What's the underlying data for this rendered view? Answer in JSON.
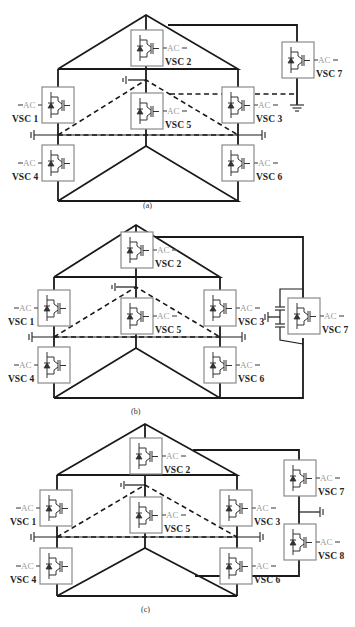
{
  "figure": {
    "ac_label": "AC",
    "panels": [
      {
        "id": "a",
        "caption": "(a)",
        "offset_y": 0,
        "converters": [
          {
            "id": "vsc1",
            "label": "VSC 1",
            "x": 42,
            "y": 87,
            "ac_side": "left"
          },
          {
            "id": "vsc2",
            "label": "VSC 2",
            "x": 131,
            "y": 30,
            "ac_side": "right"
          },
          {
            "id": "vsc3",
            "label": "VSC 3",
            "x": 222,
            "y": 87,
            "ac_side": "right"
          },
          {
            "id": "vsc4",
            "label": "VSC 4",
            "x": 42,
            "y": 145,
            "ac_side": "left"
          },
          {
            "id": "vsc5",
            "label": "VSC 5",
            "x": 131,
            "y": 93,
            "ac_side": "right"
          },
          {
            "id": "vsc6",
            "label": "VSC 6",
            "x": 222,
            "y": 145,
            "ac_side": "right"
          },
          {
            "id": "vsc7",
            "label": "VSC 7",
            "x": 282,
            "y": 42,
            "ac_side": "right"
          }
        ]
      },
      {
        "id": "b",
        "caption": "(b)",
        "offset_y": 210,
        "converters": [
          {
            "id": "vsc1",
            "label": "VSC 1",
            "x": 38,
            "y": 80,
            "ac_side": "left"
          },
          {
            "id": "vsc2",
            "label": "VSC 2",
            "x": 121,
            "y": 22,
            "ac_side": "right"
          },
          {
            "id": "vsc3",
            "label": "VSC 3",
            "x": 204,
            "y": 80,
            "ac_side": "right"
          },
          {
            "id": "vsc4",
            "label": "VSC 4",
            "x": 38,
            "y": 137,
            "ac_side": "left"
          },
          {
            "id": "vsc5",
            "label": "VSC 5",
            "x": 121,
            "y": 88,
            "ac_side": "right"
          },
          {
            "id": "vsc6",
            "label": "VSC 6",
            "x": 204,
            "y": 137,
            "ac_side": "right"
          },
          {
            "id": "vsc7",
            "label": "VSC 7",
            "x": 288,
            "y": 88,
            "ac_side": "right"
          }
        ]
      },
      {
        "id": "c",
        "caption": "(c)",
        "offset_y": 415,
        "converters": [
          {
            "id": "vsc1",
            "label": "VSC 1",
            "x": 40,
            "y": 75,
            "ac_side": "left"
          },
          {
            "id": "vsc2",
            "label": "VSC 2",
            "x": 130,
            "y": 23,
            "ac_side": "right"
          },
          {
            "id": "vsc3",
            "label": "VSC 3",
            "x": 220,
            "y": 75,
            "ac_side": "right"
          },
          {
            "id": "vsc4",
            "label": "VSC 4",
            "x": 40,
            "y": 133,
            "ac_side": "left"
          },
          {
            "id": "vsc5",
            "label": "VSC 5",
            "x": 130,
            "y": 82,
            "ac_side": "right"
          },
          {
            "id": "vsc6",
            "label": "VSC 6",
            "x": 220,
            "y": 133,
            "ac_side": "right"
          },
          {
            "id": "vsc7",
            "label": "VSC 7",
            "x": 284,
            "y": 45,
            "ac_side": "right"
          },
          {
            "id": "vsc8",
            "label": "VSC 8",
            "x": 284,
            "y": 109,
            "ac_side": "right"
          }
        ]
      }
    ]
  },
  "colors": {
    "wire": "#1a1a1a",
    "box_border": "#8a8a8a",
    "ac_text": "#9a9a9a",
    "label_text": "#222222"
  }
}
